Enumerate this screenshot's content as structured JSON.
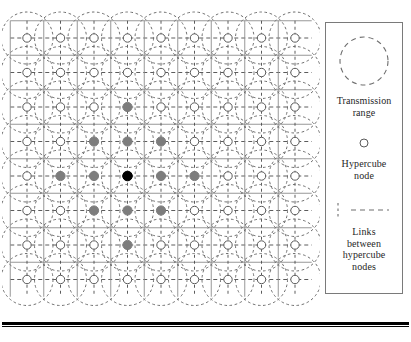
{
  "figure": {
    "background_color": "#ffffff"
  },
  "grid": {
    "columns": 9,
    "rows": 8,
    "origin_x": 27,
    "origin_y": 38,
    "spacing_x": 33.5,
    "spacing_y": 34.5,
    "range_radius": 26,
    "node_radius": 4.2,
    "colors": {
      "range_circle": "#6e6e6e",
      "link_line": "#4a4a4a",
      "link_line_solid": "#8c8c8c",
      "node_open_stroke": "#5a5a5a",
      "node_open_fill": "#ffffff",
      "node_gray_fill": "#7d7d7d",
      "node_black_fill": "#000000"
    },
    "source_node": {
      "col": 3,
      "row": 4
    },
    "highlighted_nodes": [
      {
        "col": 3,
        "row": 4,
        "state": "source"
      },
      {
        "col": 2,
        "row": 3,
        "state": "reached"
      },
      {
        "col": 3,
        "row": 3,
        "state": "reached"
      },
      {
        "col": 4,
        "row": 3,
        "state": "reached"
      },
      {
        "col": 1,
        "row": 4,
        "state": "reached"
      },
      {
        "col": 2,
        "row": 4,
        "state": "reached"
      },
      {
        "col": 4,
        "row": 4,
        "state": "reached"
      },
      {
        "col": 5,
        "row": 4,
        "state": "reached"
      },
      {
        "col": 2,
        "row": 5,
        "state": "reached"
      },
      {
        "col": 3,
        "row": 5,
        "state": "reached"
      },
      {
        "col": 4,
        "row": 5,
        "state": "reached"
      },
      {
        "col": 3,
        "row": 2,
        "state": "reached"
      },
      {
        "col": 3,
        "row": 6,
        "state": "reached"
      }
    ]
  },
  "legend": {
    "box_border_color": "#7a7a7a",
    "items": [
      {
        "icon": "dashed-circle-icon",
        "label": "Transmission\nrange",
        "label_line1": "Transmission",
        "label_line2": "range"
      },
      {
        "icon": "small-circle-icon",
        "label": "Hypercube\nnode",
        "label_line1": "Hypercube",
        "label_line2": "node"
      },
      {
        "icon": "dashed-line-icon",
        "label": "Links\nbetween\nhypercube\nnodes",
        "label_line1": "Links",
        "label_line2": "between",
        "label_line3": "hypercube",
        "label_line4": "nodes"
      }
    ]
  }
}
